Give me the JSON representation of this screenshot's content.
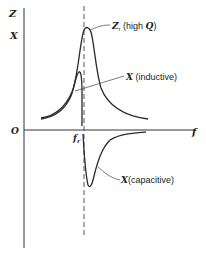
{
  "diagram": {
    "axes": {
      "y_label": "Z",
      "y_tick_label": "X",
      "origin_label": "O",
      "x_label": "f",
      "resonance_label": "f",
      "resonance_subscript": "r"
    },
    "curves": [
      {
        "id": "impedance",
        "label_main": "Z",
        "label_sub": "r",
        "label_rest": " (high ",
        "label_q": "Q",
        "label_end": ")"
      },
      {
        "id": "inductive",
        "label_main": "X",
        "label_rest": " (inductive)"
      },
      {
        "id": "capacitive",
        "label_main": "X",
        "label_rest": "(capacitive)"
      }
    ],
    "colors": {
      "ink": "#2a2a2a",
      "background": "#ffffff"
    }
  }
}
